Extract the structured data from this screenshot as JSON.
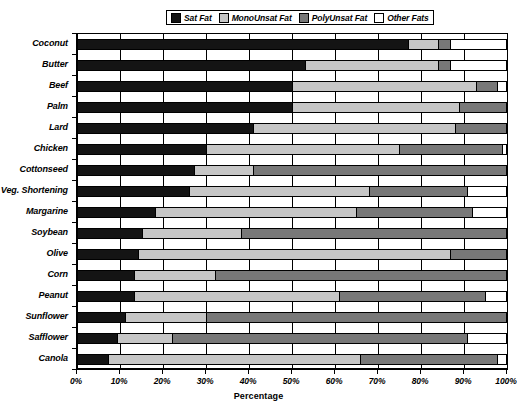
{
  "chart_data": {
    "type": "bar",
    "subtype": "horizontal-stacked-100",
    "title": "",
    "xlabel": "Percentage",
    "ylabel": "",
    "xlim": [
      0,
      100
    ],
    "xticks": [
      "0%",
      "10%",
      "20%",
      "30%",
      "40%",
      "50%",
      "60%",
      "70%",
      "80%",
      "90%",
      "100%"
    ],
    "xtick_values": [
      0,
      10,
      20,
      30,
      40,
      50,
      60,
      70,
      80,
      90,
      100
    ],
    "grid": true,
    "legend_position": "top-center",
    "legend": [
      "Sat Fat",
      "MonoUnsat Fat",
      "PolyUnsat Fat",
      "Other Fats"
    ],
    "colors": [
      "#141414",
      "#c6c6c6",
      "#787878",
      "#ffffff"
    ],
    "categories": [
      "Coconut",
      "Butter",
      "Beef",
      "Palm",
      "Lard",
      "Chicken",
      "Cottonseed",
      "Veg. Shortening",
      "Margarine",
      "Soybean",
      "Olive",
      "Corn",
      "Peanut",
      "Sunflower",
      "Safflower",
      "Canola"
    ],
    "series": [
      {
        "name": "Sat Fat",
        "color": "#141414",
        "values": [
          77,
          53,
          50,
          50,
          41,
          30,
          27,
          26,
          18,
          15,
          14,
          13,
          13,
          11,
          9,
          7
        ]
      },
      {
        "name": "MonoUnsat Fat",
        "color": "#c6c6c6",
        "values": [
          7,
          31,
          43,
          39,
          47,
          45,
          14,
          42,
          47,
          23,
          73,
          19,
          48,
          19,
          13,
          59
        ]
      },
      {
        "name": "PolyUnsat Fat",
        "color": "#787878",
        "values": [
          3,
          3,
          5,
          11,
          12,
          24,
          59,
          23,
          27,
          62,
          13,
          68,
          34,
          70,
          69,
          32
        ]
      },
      {
        "name": "Other Fats",
        "color": "#ffffff",
        "values": [
          13,
          13,
          2,
          0,
          0,
          1,
          0,
          9,
          8,
          0,
          0,
          0,
          5,
          0,
          9,
          2
        ]
      }
    ]
  }
}
